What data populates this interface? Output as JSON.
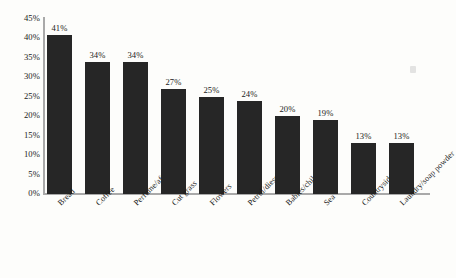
{
  "chart_data": {
    "type": "bar",
    "title": "",
    "subtitle": "",
    "xlabel": "",
    "ylabel": "",
    "ylim": [
      0,
      45
    ],
    "grid": false,
    "legend": null,
    "orientation": "vertical",
    "bar_color": "#262626",
    "axis_color": "#a9a9a9",
    "background_color": "#fdfdfb",
    "value_label_suffix": "%",
    "categories": [
      "Bread",
      "Coffee",
      "Perfume/aftershave",
      "Cut grass",
      "Flowers",
      "Petrol/diesel",
      "Babies/children",
      "Sea",
      "Countryside/trees",
      "Laundry/soap powder"
    ],
    "values": [
      41,
      34,
      34,
      27,
      25,
      24,
      20,
      19,
      13,
      13
    ],
    "value_labels": [
      "41%",
      "34%",
      "34%",
      "27%",
      "25%",
      "24%",
      "20%",
      "19%",
      "13%",
      "13%"
    ],
    "yticks": [
      45,
      40,
      35,
      30,
      25,
      20,
      15,
      10,
      5,
      0
    ],
    "ytick_labels": [
      "45%",
      "40%",
      "35%",
      "30%",
      "25%",
      "20%",
      "15%",
      "10%",
      "5%",
      "0%"
    ]
  },
  "artifacts": {
    "scan_speck": "scan-speck"
  }
}
